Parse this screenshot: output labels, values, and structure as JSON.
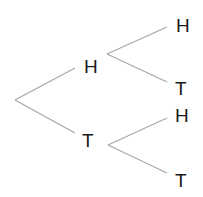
{
  "diagram": {
    "type": "probability-tree",
    "edge_color": "#a8a8a8",
    "text_color": "#1a1a1a",
    "level1": [
      {
        "label": "H"
      },
      {
        "label": "T"
      }
    ],
    "level2": [
      {
        "parent": "H",
        "label": "H"
      },
      {
        "parent": "H",
        "label": "T"
      },
      {
        "parent": "T",
        "label": "H"
      },
      {
        "parent": "T",
        "label": "T"
      }
    ]
  }
}
